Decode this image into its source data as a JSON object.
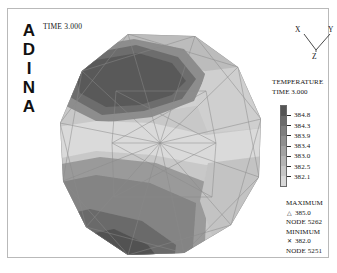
{
  "window": {
    "application": "ADINA",
    "logo_letters": [
      "A",
      "D",
      "I",
      "N",
      "A"
    ]
  },
  "header": {
    "time_label": "TIME 3.000"
  },
  "axis_triad": {
    "x_label": "X",
    "y_label": "Y",
    "z_label": "Z"
  },
  "legend": {
    "title": "TEMPERATURE",
    "time": "TIME 3.000",
    "tick_labels": [
      "384.8",
      "384.3",
      "383.9",
      "383.4",
      "383.0",
      "382.5",
      "382.1"
    ],
    "band_colors": [
      "#555555",
      "#6b6b6b",
      "#7e7e7e",
      "#8f8f8f",
      "#a2a2a2",
      "#b4b4b4",
      "#c6c6c6",
      "#d8d8d8"
    ]
  },
  "extrema": {
    "maximum_label": "MAXIMUM",
    "maximum_marker": "triangle-marker",
    "maximum_value": "385.0",
    "maximum_node_label": "NODE 5262",
    "minimum_label": "MINIMUM",
    "minimum_marker": "cross-marker",
    "minimum_value": "382.0",
    "minimum_node_label": "NODE 5251"
  },
  "chart_data": {
    "type": "heatmap",
    "title": "TEMPERATURE",
    "subtitle": "TIME 3.000",
    "colormap": "grayscale",
    "contour_levels": [
      384.8,
      384.3,
      383.9,
      383.4,
      383.0,
      382.5,
      382.1
    ],
    "value_range": [
      382.0,
      385.0
    ],
    "maximum": 385.0,
    "maximum_node": 5262,
    "minimum": 382.0,
    "minimum_node": 5251,
    "units": "temperature",
    "geometry": "circular polygonal triangulated finite-element disc",
    "legend_position": "right",
    "grid": false,
    "mesh_visible": true,
    "band_colors": [
      "#555555",
      "#6b6b6b",
      "#7e7e7e",
      "#8f8f8f",
      "#a2a2a2",
      "#b4b4b4",
      "#c6c6c6",
      "#d8d8d8"
    ]
  }
}
